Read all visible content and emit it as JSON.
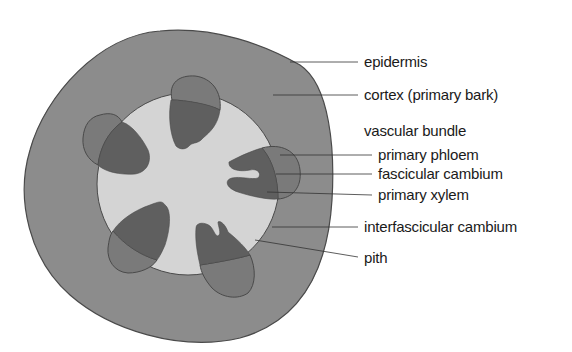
{
  "diagram": {
    "colors": {
      "background": "#ffffff",
      "cortex": "#8c8c8c",
      "outline": "#4a4a4a",
      "pith": "#d4d4d4",
      "xylem": "#5f5f5f",
      "phloem": "#7a7a7a",
      "leader_line": "#333333",
      "text": "#1a1a1a"
    },
    "labels": [
      {
        "id": "epidermis",
        "text": "epidermis"
      },
      {
        "id": "cortex",
        "text": "cortex (primary bark)"
      },
      {
        "id": "vascular-bundle",
        "text": "vascular bundle"
      },
      {
        "id": "primary-phloem",
        "text": "primary phloem"
      },
      {
        "id": "fascicular-cambium",
        "text": "fascicular cambium"
      },
      {
        "id": "primary-xylem",
        "text": "primary xylem"
      },
      {
        "id": "interfascicular-cambium",
        "text": "interfascicular cambium"
      },
      {
        "id": "pith",
        "text": "pith"
      }
    ],
    "vascular_bundle_count": 5
  }
}
